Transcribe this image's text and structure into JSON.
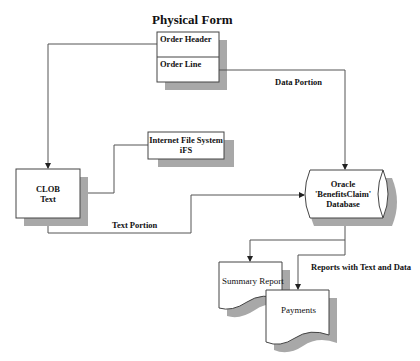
{
  "diagram": {
    "title": "Physical Form",
    "nodes": {
      "order_form": {
        "header_label": "Order Header",
        "line_label": "Order Line"
      },
      "clob": {
        "line1": "CLOB",
        "line2": "Text"
      },
      "ifs": {
        "line1": "Internet File System",
        "line2": "iFS"
      },
      "database": {
        "line1": "Oracle",
        "line2": "'BenefitsClaim'",
        "line3": "Database"
      },
      "summary_report": {
        "label": "Summary Report"
      },
      "payments": {
        "label": "Payments"
      }
    },
    "edge_labels": {
      "data_portion": "Data Portion",
      "text_portion": "Text Portion",
      "reports": "Reports with Text and Data"
    },
    "colors": {
      "line": "#555555",
      "shadow": "#a8a8a8",
      "box_border": "#444444",
      "box_fill": "#ffffff",
      "text": "#111111"
    }
  }
}
